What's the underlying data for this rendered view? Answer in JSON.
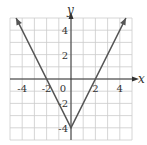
{
  "chart_data": {
    "type": "line",
    "title": "",
    "function": "y = 2|x| - 4",
    "xlabel": "x",
    "ylabel": "y",
    "xlim": [
      -5,
      5
    ],
    "ylim": [
      -5,
      5
    ],
    "grid": true,
    "x_ticks": [
      -4,
      -2,
      0,
      2,
      4
    ],
    "y_ticks": [
      4,
      2,
      -2,
      -4
    ],
    "x_tick_labels": [
      "-4",
      "-2",
      "0",
      "2",
      "4"
    ],
    "y_tick_labels": [
      "4",
      "2",
      "-2",
      "-4"
    ],
    "series": [
      {
        "name": "absolute value graph",
        "points": [
          [
            -4.5,
            5
          ],
          [
            0,
            -4
          ],
          [
            4.5,
            5
          ]
        ],
        "arrows_at_ends": true,
        "color": "#555555"
      }
    ],
    "vertex": [
      0,
      -4
    ],
    "x_intercepts": [
      -2,
      2
    ]
  },
  "colors": {
    "grid": "#cccccc",
    "axis": "#333333",
    "line": "#555555"
  }
}
